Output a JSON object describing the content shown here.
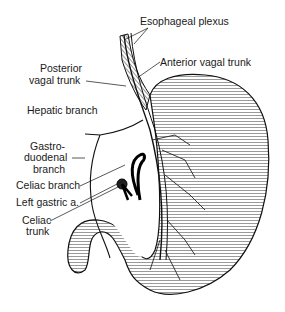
{
  "diagram": {
    "labels": [
      {
        "id": "esophageal_plexus",
        "text": "Esophageal plexus"
      },
      {
        "id": "anterior_vagal_trunk",
        "text": "Anterior vagal trunk"
      },
      {
        "id": "posterior_vagal_trunk_1",
        "text": "Posterior"
      },
      {
        "id": "posterior_vagal_trunk_2",
        "text": "vagal trunk"
      },
      {
        "id": "hepatic_branch",
        "text": "Hepatic branch"
      },
      {
        "id": "gastroduodenal_1",
        "text": "Gastro-"
      },
      {
        "id": "gastroduodenal_2",
        "text": "duodenal"
      },
      {
        "id": "gastroduodenal_3",
        "text": "branch"
      },
      {
        "id": "celiac_branch",
        "text": "Celiac branch"
      },
      {
        "id": "left_gastric",
        "text": "Left gastric a."
      },
      {
        "id": "celiac_trunk_1",
        "text": "Celiac"
      },
      {
        "id": "celiac_trunk_2",
        "text": "trunk"
      }
    ]
  }
}
